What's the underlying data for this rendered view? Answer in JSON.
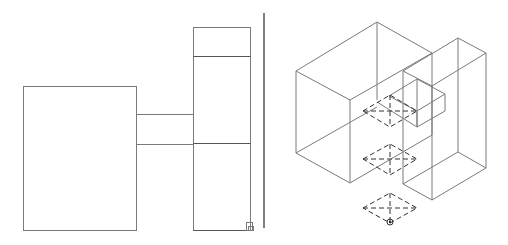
{
  "drawing": {
    "type": "CAD multi-view drawing",
    "colors": {
      "background": "#ffffff",
      "line": "#7a7a7a",
      "dark_line": "#555555",
      "hidden_line": "#333333",
      "divider": "#555555"
    },
    "views": [
      {
        "name": "plan-view",
        "position": "left"
      },
      {
        "name": "isometric-view",
        "position": "right"
      }
    ],
    "markers": {
      "ucs_icon": "square-corner-marker",
      "base_point": "circle-marker"
    }
  }
}
